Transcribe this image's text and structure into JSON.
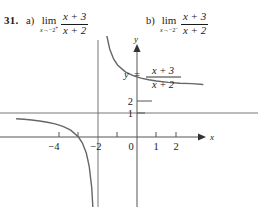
{
  "problem": {
    "number": "31.",
    "parts": [
      {
        "label": "a)",
        "lim_word": "lim",
        "lim_sub_var": "x",
        "lim_sub_arrow": "→",
        "lim_sub_value": "−2",
        "lim_sub_side": "+",
        "numerator": "x + 3",
        "denominator": "x + 2"
      },
      {
        "label": "b)",
        "lim_word": "lim",
        "lim_sub_var": "x",
        "lim_sub_arrow": "→",
        "lim_sub_value": "−2",
        "lim_sub_side": "−",
        "numerator": "x + 3",
        "denominator": "x + 2"
      }
    ]
  },
  "graph": {
    "equation": {
      "lhs": "y",
      "equals": "=",
      "numerator": "x + 3",
      "denominator": "x + 2"
    },
    "x_axis_name": "x",
    "y_axis_name": "y",
    "x_ticks": [
      {
        "label": "−4",
        "value": -4
      },
      {
        "label": "−2",
        "value": -2
      },
      {
        "label": "0",
        "value": 0
      },
      {
        "label": "1",
        "value": 1
      },
      {
        "label": "2",
        "value": 2
      }
    ],
    "y_ticks": [
      {
        "label": "1",
        "value": 1
      },
      {
        "label": "2",
        "value": 2
      }
    ],
    "curve_color": "#666666",
    "axis_color": "#555555",
    "asymptote_color": "#777777"
  },
  "chart_data": {
    "type": "line",
    "title": "",
    "xlabel": "x",
    "ylabel": "y",
    "function": "y = (x + 3) / (x + 2)",
    "xlim": [
      -6.2,
      3.4
    ],
    "ylim": [
      -3.6,
      6.2
    ],
    "grid": false,
    "legend": "none",
    "annotations": [
      {
        "text": "y = (x + 3)/(x + 2)",
        "x": 0.45,
        "y": 3.6
      }
    ],
    "asymptotes": [
      {
        "type": "vertical",
        "value": -2
      },
      {
        "type": "horizontal",
        "value": 1
      }
    ],
    "xticks": [
      -4,
      -2,
      0,
      1,
      2
    ],
    "xticklabels": [
      "−4",
      "−2",
      "0",
      "1",
      "2"
    ],
    "yticks": [
      1,
      2
    ],
    "yticklabels": [
      "1",
      "2"
    ],
    "series": [
      {
        "name": "left branch (x < -2)",
        "x": [
          -6.2,
          -5.8,
          -5.4,
          -5.0,
          -4.6,
          -4.2,
          -3.8,
          -3.4,
          -3.0,
          -2.8,
          -2.6,
          -2.45,
          -2.32,
          -2.22,
          -2.15,
          -2.1,
          -2.06,
          -2.035,
          -2.02
        ],
        "y": [
          0.7619,
          0.7368,
          0.7059,
          0.6667,
          0.6154,
          0.5455,
          0.4444,
          0.2857,
          0.0,
          -0.25,
          -0.6667,
          -1.2222,
          -2.125,
          -3.545,
          -5.667,
          -9.0,
          -16.0,
          -27.57,
          -48.0
        ]
      },
      {
        "name": "right branch (x > -2)",
        "x": [
          -1.98,
          -1.965,
          -1.94,
          -1.9,
          -1.85,
          -1.78,
          -1.68,
          -1.55,
          -1.4,
          -1.2,
          -1.0,
          -0.6,
          -0.2,
          0.2,
          0.6,
          1.0,
          1.6,
          2.2,
          2.8,
          3.4
        ],
        "y": [
          52.0,
          30.57,
          18.0,
          11.0,
          8.667,
          6.545,
          5.125,
          4.222,
          3.667,
          3.25,
          3.0,
          2.714,
          2.556,
          2.455,
          2.385,
          2.333,
          2.2778,
          2.2381,
          2.2222,
          2.1852
        ]
      }
    ]
  }
}
